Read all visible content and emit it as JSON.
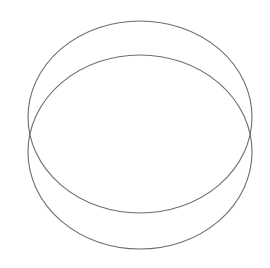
{
  "canvas": {
    "width": 270,
    "height": 268,
    "background": "#ffffff"
  },
  "stroke_color": "#6e6e6e",
  "shapes": [
    {
      "type": "ellipse",
      "name": "upper-ellipse",
      "cx": 140,
      "cy": 117,
      "rx": 112,
      "ry": 96
    },
    {
      "type": "ellipse",
      "name": "lower-ellipse",
      "cx": 140,
      "cy": 152,
      "rx": 112,
      "ry": 97
    }
  ]
}
